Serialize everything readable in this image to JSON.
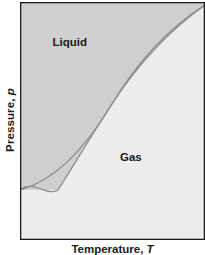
{
  "figure": {
    "title": "",
    "background": "#ffffff"
  },
  "axes": {
    "x": {
      "label_text": "Temperature, ",
      "label_symbol": "T"
    },
    "y": {
      "label_text": "Pressure, ",
      "label_symbol": "p"
    },
    "frame_color": "#1b1b1b",
    "show_ticks": false,
    "show_gridlines": false
  },
  "regions": [
    {
      "name": "liquid",
      "label": "Liquid",
      "fill": "#cfcfcf"
    },
    {
      "name": "gas",
      "label": "Gas",
      "fill": "#ededed"
    }
  ],
  "chart_data": {
    "type": "line",
    "title": "",
    "xlabel": "Temperature, T",
    "ylabel": "Pressure, p",
    "xlim": [
      0,
      1
    ],
    "ylim": [
      0,
      1
    ],
    "grid": false,
    "legend": null,
    "annotations": [
      {
        "text": "Liquid",
        "x": 0.27,
        "y": 0.83
      },
      {
        "text": "Gas",
        "x": 0.6,
        "y": 0.35
      }
    ],
    "series": [
      {
        "name": "phase-boundary",
        "color": "#8c8c8c",
        "x": [
          0.0,
          0.1,
          0.2,
          0.3,
          0.4,
          0.5,
          0.6,
          0.7,
          0.8,
          0.9,
          1.0
        ],
        "y": [
          0.2,
          0.27,
          0.34,
          0.42,
          0.5,
          0.58,
          0.67,
          0.76,
          0.85,
          0.93,
          0.99
        ]
      }
    ]
  }
}
